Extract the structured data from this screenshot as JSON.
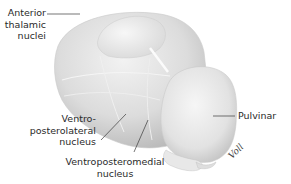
{
  "figure": {
    "labels": {
      "anterior": [
        "Anterior",
        "thalamic",
        "nuclei"
      ],
      "vpl": [
        "Ventro-",
        "posterolateral",
        "nucleus"
      ],
      "vpm": [
        "Ventroposteromedial",
        "nucleus"
      ],
      "pulvinar": "Pulvinar"
    },
    "signature": "Voll",
    "colors": {
      "background": "#ffffff",
      "structure_light": "#efefef",
      "structure_mid": "#d6d6d6",
      "structure_dark": "#bcbcbc",
      "leader_line": "#3a3a3a",
      "text": "#2a2a2a"
    }
  }
}
